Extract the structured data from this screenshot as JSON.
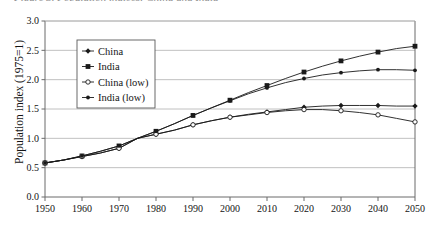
{
  "figure": {
    "cropped_caption": "Figure 3. Population indices: China and India",
    "background": "#ffffff",
    "axis_color": "#6b6b6b",
    "grid_color": "#b0b0b0",
    "series_color": "#1a1a1a"
  },
  "axes": {
    "ylabel": "Population index (1975=1)",
    "yticks": [
      "0.0",
      "0.5",
      "1.0",
      "1.5",
      "2.0",
      "2.5",
      "3.0"
    ],
    "xticks": [
      "1950",
      "1960",
      "1970",
      "1980",
      "1990",
      "2000",
      "2010",
      "2020",
      "2030",
      "2040",
      "2050"
    ]
  },
  "legend": {
    "items": [
      {
        "label": "China",
        "marker": "filled-diamond-marker"
      },
      {
        "label": "India",
        "marker": "filled-square-marker"
      },
      {
        "label": "China (low)",
        "marker": "open-circle-marker"
      },
      {
        "label": "India (low)",
        "marker": "filled-circle-marker"
      }
    ]
  },
  "chart_data": {
    "type": "line",
    "title": "Figure 3. Population indices: China and India",
    "xlabel": "",
    "ylabel": "Population index (1975=1)",
    "xlim": [
      1950,
      2050
    ],
    "ylim": [
      0.0,
      3.0
    ],
    "ytick_values": [
      0.0,
      0.5,
      1.0,
      1.5,
      2.0,
      2.5,
      3.0
    ],
    "xtick_values": [
      1950,
      1960,
      1970,
      1980,
      1990,
      2000,
      2010,
      2020,
      2030,
      2040,
      2050
    ],
    "grid": "horizontal",
    "legend_position": "upper-left-inside",
    "x": [
      1950,
      1955,
      1960,
      1965,
      1970,
      1975,
      1980,
      1985,
      1990,
      1995,
      2000,
      2005,
      2010,
      2015,
      2020,
      2025,
      2030,
      2035,
      2040,
      2045,
      2050
    ],
    "series": [
      {
        "name": "China",
        "marker": "filled-diamond",
        "values": [
          0.58,
          0.63,
          0.69,
          0.75,
          0.83,
          1.0,
          1.07,
          1.14,
          1.23,
          1.3,
          1.36,
          1.41,
          1.45,
          1.49,
          1.53,
          1.55,
          1.56,
          1.56,
          1.56,
          1.55,
          1.55
        ]
      },
      {
        "name": "India",
        "marker": "filled-square",
        "values": [
          0.58,
          0.63,
          0.7,
          0.78,
          0.87,
          1.0,
          1.12,
          1.25,
          1.39,
          1.52,
          1.65,
          1.78,
          1.9,
          2.02,
          2.13,
          2.23,
          2.32,
          2.4,
          2.47,
          2.53,
          2.57
        ]
      },
      {
        "name": "China (low)",
        "marker": "open-circle",
        "values": [
          0.58,
          0.63,
          0.69,
          0.75,
          0.83,
          1.0,
          1.07,
          1.14,
          1.23,
          1.3,
          1.36,
          1.4,
          1.44,
          1.47,
          1.49,
          1.49,
          1.47,
          1.44,
          1.4,
          1.34,
          1.28
        ]
      },
      {
        "name": "India (low)",
        "marker": "filled-circle",
        "values": [
          0.58,
          0.63,
          0.7,
          0.78,
          0.87,
          1.0,
          1.12,
          1.25,
          1.39,
          1.52,
          1.64,
          1.76,
          1.86,
          1.95,
          2.02,
          2.08,
          2.12,
          2.15,
          2.17,
          2.17,
          2.16
        ]
      }
    ]
  }
}
